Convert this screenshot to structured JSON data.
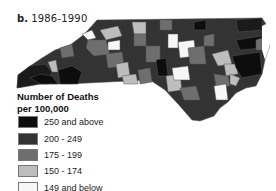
{
  "title": {
    "prefix": "b.",
    "period": "1986-1990"
  },
  "legend": {
    "title_line1": "Number of Deaths",
    "title_line2": "per 100,000",
    "items": [
      {
        "label": "250 and above",
        "color": "#0d0d0d"
      },
      {
        "label": "200 - 249",
        "color": "#333333"
      },
      {
        "label": "175 - 199",
        "color": "#6e6e6e"
      },
      {
        "label": "150 - 174",
        "color": "#bdbdbd"
      },
      {
        "label": "149 and below",
        "color": "#f7f7f7"
      }
    ]
  },
  "map": {
    "region": "North Carolina counties",
    "shading_classes": [
      "250 and above",
      "200 - 249",
      "175 - 199",
      "150 - 174",
      "149 and below"
    ]
  }
}
